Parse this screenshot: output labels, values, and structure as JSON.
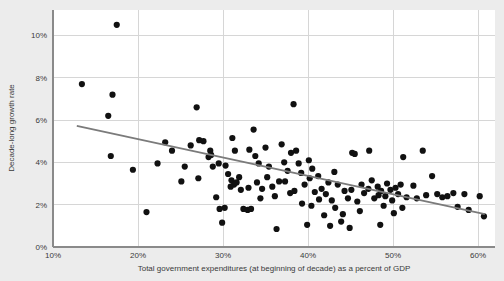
{
  "chart_data": {
    "type": "scatter",
    "title": "",
    "xlabel": "Total government expenditures (at beginning of decade) as a percent of GDP",
    "ylabel": "Decade-long growth rate",
    "xlim": [
      10,
      62
    ],
    "ylim": [
      0,
      11.2
    ],
    "grid": true,
    "legend": "none",
    "xticks": [
      10,
      20,
      30,
      40,
      50,
      60
    ],
    "xtick_labels": [
      "10%",
      "20%",
      "30%",
      "40%",
      "50%",
      "60%"
    ],
    "yticks": [
      0,
      2,
      4,
      6,
      8,
      10
    ],
    "ytick_labels": [
      "0%",
      "2%",
      "4%",
      "6%",
      "8%",
      "10%"
    ],
    "point_color": "#111111",
    "trend_color": "#7b7b7b",
    "background_color": "#ececec",
    "plot_background_color": "#ffffff",
    "grid_color": "#d6d6d6",
    "trendline": {
      "type": "linear-fit",
      "x_start": 12.8,
      "y_start": 5.72,
      "x_end": 60.8,
      "y_end": 1.55
    },
    "points": [
      [
        13.4,
        7.7
      ],
      [
        17.5,
        10.5
      ],
      [
        17.0,
        7.2
      ],
      [
        16.5,
        6.2
      ],
      [
        16.8,
        4.3
      ],
      [
        19.4,
        3.65
      ],
      [
        21.0,
        1.65
      ],
      [
        22.3,
        3.95
      ],
      [
        23.2,
        4.95
      ],
      [
        25.5,
        3.8
      ],
      [
        25.1,
        3.1
      ],
      [
        26.9,
        6.6
      ],
      [
        27.2,
        5.05
      ],
      [
        27.7,
        5.0
      ],
      [
        27.1,
        3.25
      ],
      [
        28.5,
        4.55
      ],
      [
        28.3,
        4.25
      ],
      [
        28.6,
        4.35
      ],
      [
        28.8,
        3.8
      ],
      [
        29.5,
        3.95
      ],
      [
        29.2,
        2.35
      ],
      [
        29.6,
        1.8
      ],
      [
        30.2,
        1.85
      ],
      [
        29.9,
        1.15
      ],
      [
        30.3,
        3.85
      ],
      [
        30.6,
        3.45
      ],
      [
        31.1,
        5.15
      ],
      [
        31.4,
        4.55
      ],
      [
        31.0,
        3.15
      ],
      [
        31.6,
        3.05
      ],
      [
        31.3,
        2.95
      ],
      [
        31.9,
        3.3
      ],
      [
        32.1,
        2.7
      ],
      [
        32.4,
        1.8
      ],
      [
        32.9,
        1.75
      ],
      [
        33.3,
        1.8
      ],
      [
        33.6,
        5.55
      ],
      [
        33.1,
        4.6
      ],
      [
        33.8,
        4.3
      ],
      [
        34.2,
        3.95
      ],
      [
        34.0,
        3.05
      ],
      [
        34.6,
        2.75
      ],
      [
        34.4,
        2.3
      ],
      [
        35.0,
        4.7
      ],
      [
        35.4,
        3.8
      ],
      [
        35.2,
        3.3
      ],
      [
        35.8,
        2.85
      ],
      [
        36.1,
        2.4
      ],
      [
        36.3,
        0.85
      ],
      [
        36.9,
        4.85
      ],
      [
        37.2,
        4.0
      ],
      [
        37.6,
        3.6
      ],
      [
        37.3,
        3.1
      ],
      [
        37.9,
        2.55
      ],
      [
        38.3,
        6.75
      ],
      [
        38.0,
        4.45
      ],
      [
        38.6,
        4.55
      ],
      [
        38.9,
        3.95
      ],
      [
        38.4,
        2.65
      ],
      [
        39.2,
        3.5
      ],
      [
        39.6,
        2.95
      ],
      [
        39.3,
        2.05
      ],
      [
        40.1,
        4.1
      ],
      [
        40.5,
        3.7
      ],
      [
        40.2,
        3.25
      ],
      [
        40.8,
        2.6
      ],
      [
        40.4,
        1.95
      ],
      [
        41.2,
        3.35
      ],
      [
        41.6,
        2.75
      ],
      [
        41.3,
        2.25
      ],
      [
        41.9,
        1.5
      ],
      [
        42.4,
        3.05
      ],
      [
        42.1,
        2.5
      ],
      [
        42.8,
        2.2
      ],
      [
        43.1,
        3.55
      ],
      [
        43.5,
        2.95
      ],
      [
        43.2,
        1.85
      ],
      [
        43.9,
        1.2
      ],
      [
        44.3,
        2.65
      ],
      [
        44.7,
        2.3
      ],
      [
        44.1,
        1.55
      ],
      [
        45.2,
        4.45
      ],
      [
        45.5,
        4.4
      ],
      [
        45.1,
        2.7
      ],
      [
        45.8,
        2.15
      ],
      [
        46.3,
        2.95
      ],
      [
        46.6,
        2.55
      ],
      [
        46.1,
        1.7
      ],
      [
        47.2,
        4.55
      ],
      [
        47.5,
        3.15
      ],
      [
        47.1,
        2.75
      ],
      [
        47.8,
        2.3
      ],
      [
        48.2,
        2.85
      ],
      [
        48.6,
        2.65
      ],
      [
        48.3,
        2.45
      ],
      [
        48.9,
        1.95
      ],
      [
        48.5,
        1.05
      ],
      [
        49.3,
        3.0
      ],
      [
        49.7,
        2.7
      ],
      [
        49.1,
        2.4
      ],
      [
        49.9,
        2.2
      ],
      [
        50.3,
        2.8
      ],
      [
        50.6,
        2.5
      ],
      [
        50.1,
        1.6
      ],
      [
        51.2,
        4.25
      ],
      [
        51.6,
        2.35
      ],
      [
        51.1,
        1.85
      ],
      [
        52.4,
        2.9
      ],
      [
        52.8,
        2.3
      ],
      [
        53.5,
        4.55
      ],
      [
        53.9,
        2.45
      ],
      [
        54.6,
        3.35
      ],
      [
        55.2,
        2.5
      ],
      [
        55.8,
        2.35
      ],
      [
        56.4,
        2.4
      ],
      [
        57.1,
        2.55
      ],
      [
        57.6,
        1.9
      ],
      [
        58.4,
        2.5
      ],
      [
        58.9,
        1.75
      ],
      [
        60.2,
        2.4
      ],
      [
        60.7,
        1.45
      ],
      [
        24.0,
        4.55
      ],
      [
        26.2,
        4.8
      ],
      [
        30.9,
        2.85
      ],
      [
        33.0,
        2.8
      ],
      [
        36.6,
        3.1
      ],
      [
        39.9,
        1.05
      ],
      [
        42.6,
        1.0
      ],
      [
        44.9,
        0.9
      ],
      [
        50.9,
        2.95
      ]
    ]
  }
}
